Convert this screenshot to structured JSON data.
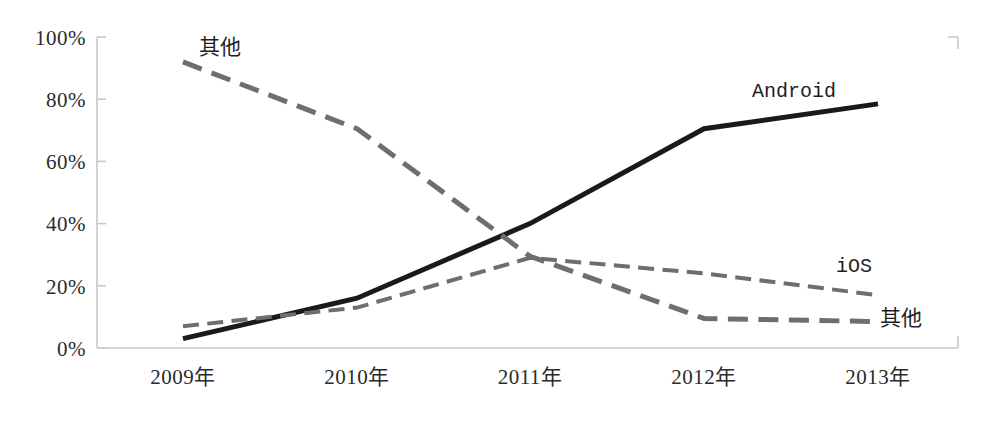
{
  "chart_data": {
    "type": "line",
    "title": "",
    "subtitle": "",
    "xlabel": "",
    "ylabel": "",
    "categories": [
      "2009年",
      "2010年",
      "2011年",
      "2012年",
      "2013年"
    ],
    "x_tick_labels": [
      "2009年",
      "2010年",
      "2011年",
      "2012年",
      "2013年"
    ],
    "y_tick_labels": [
      "0%",
      "20%",
      "40%",
      "60%",
      "80%",
      "100%"
    ],
    "y_tick_values": [
      0,
      20,
      40,
      60,
      80,
      100
    ],
    "ylim": [
      0,
      100
    ],
    "grid": false,
    "legend": "inline-annotations",
    "series": [
      {
        "name": "Android",
        "values": [
          3,
          16,
          40,
          70.5,
          78.5
        ],
        "style": "solid",
        "color": "#1a1a1a",
        "width": 5,
        "label": "Android",
        "label_x": 752,
        "label_y": 78
      },
      {
        "name": "iOS",
        "values": [
          7,
          13,
          29,
          24,
          17
        ],
        "style": "dashed",
        "color": "#6e6e6e",
        "width": 4,
        "label": "iOS",
        "label_x": 836,
        "label_y": 253
      },
      {
        "name": "其他",
        "values": [
          92,
          70.5,
          29.5,
          9.5,
          8.5
        ],
        "style": "dashed",
        "color": "#6e6e6e",
        "width": 5,
        "label": "其他",
        "label_x": 199,
        "label_y": 30
      }
    ],
    "annotations": [
      {
        "text": "其他",
        "x": 199,
        "y": 30,
        "series": "其他"
      },
      {
        "text": "Android",
        "x": 752,
        "y": 78,
        "series": "Android"
      },
      {
        "text": "iOS",
        "x": 836,
        "y": 253,
        "series": "iOS"
      },
      {
        "text": "其他",
        "x": 880,
        "y": 300,
        "series": "其他"
      }
    ]
  },
  "axis": {
    "y": {
      "labels": [
        "100%",
        "80%",
        "60%",
        "40%",
        "20%",
        "0%"
      ],
      "line_color": "#c9c9c9"
    },
    "x": {
      "labels": [
        "2009年",
        "2010年",
        "2011年",
        "2012年",
        "2013年"
      ],
      "line_color": "#c9c9c9"
    }
  },
  "annotation_labels": {
    "others_top": "其他",
    "android": "Android",
    "ios": "iOS",
    "others_bottom": "其他"
  }
}
